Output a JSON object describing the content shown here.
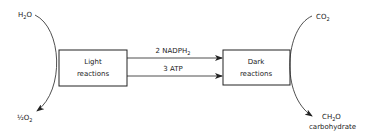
{
  "diagram": {
    "boxes": {
      "light": {
        "line1": "Light",
        "line2": "reactions"
      },
      "dark": {
        "line1": "Dark",
        "line2": "reactions"
      }
    },
    "arrows": {
      "top": {
        "label_main": "2 NADPH",
        "label_sub": "2"
      },
      "bottom": {
        "label_main": "3 ATP"
      }
    },
    "inputs": {
      "water": {
        "main": "H",
        "sub": "2",
        "tail": "O"
      },
      "co2": {
        "main": "CO",
        "sub": "2"
      }
    },
    "outputs": {
      "oxygen": {
        "frac": "½",
        "main": "O",
        "sub": "2"
      },
      "carbohydrate": {
        "main": "CH",
        "sub": "2",
        "tail": "O",
        "name": "carbohydrate"
      }
    },
    "colors": {
      "ink": "#222222",
      "background": "#ffffff"
    }
  }
}
